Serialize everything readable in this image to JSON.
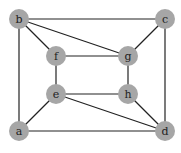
{
  "graph": {
    "node_color": "#a6a6a6",
    "edge_color": "#222222",
    "node_radius": 10,
    "nodes": [
      {
        "id": "b",
        "label": "b",
        "x": 19,
        "y": 19
      },
      {
        "id": "c",
        "label": "c",
        "x": 165,
        "y": 19
      },
      {
        "id": "f",
        "label": "f",
        "x": 56,
        "y": 56
      },
      {
        "id": "g",
        "label": "g",
        "x": 128,
        "y": 56
      },
      {
        "id": "e",
        "label": "e",
        "x": 56,
        "y": 94
      },
      {
        "id": "h",
        "label": "h",
        "x": 128,
        "y": 94
      },
      {
        "id": "a",
        "label": "a",
        "x": 19,
        "y": 131
      },
      {
        "id": "d",
        "label": "d",
        "x": 165,
        "y": 131
      }
    ],
    "edges": [
      [
        "b",
        "c"
      ],
      [
        "b",
        "a"
      ],
      [
        "b",
        "f"
      ],
      [
        "b",
        "g"
      ],
      [
        "c",
        "g"
      ],
      [
        "c",
        "d"
      ],
      [
        "f",
        "g"
      ],
      [
        "f",
        "e"
      ],
      [
        "g",
        "h"
      ],
      [
        "e",
        "h"
      ],
      [
        "e",
        "a"
      ],
      [
        "e",
        "d"
      ],
      [
        "h",
        "d"
      ],
      [
        "a",
        "d"
      ]
    ]
  }
}
